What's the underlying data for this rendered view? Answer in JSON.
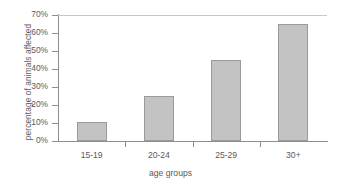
{
  "chart_data": {
    "type": "bar",
    "title": "",
    "categories": [
      "15-19",
      "20-24",
      "25-29",
      "30+"
    ],
    "values": [
      10.5,
      25,
      45,
      65
    ],
    "xlabel": "age groups",
    "ylabel": "percentage of animals affected",
    "ylim": [
      0,
      70
    ],
    "ytick_labels": [
      "0%",
      "10%",
      "20%",
      "30%",
      "40%",
      "50%",
      "60%",
      "70%"
    ],
    "ytick_values": [
      0,
      10,
      20,
      30,
      40,
      50,
      60,
      70
    ],
    "grid": "top-line-only",
    "legend": "none",
    "series": [
      {
        "name": "percentage of animals affected",
        "values": [
          10.5,
          25,
          45,
          65
        ]
      }
    ],
    "colors": {
      "bar_fill": "#c3c3c3",
      "bar_border": "#9a9a9a",
      "axis": "#8e8e8e",
      "gridline": "#c8c8c8",
      "text": "#5a5a5a",
      "background": "#ffffff"
    }
  }
}
